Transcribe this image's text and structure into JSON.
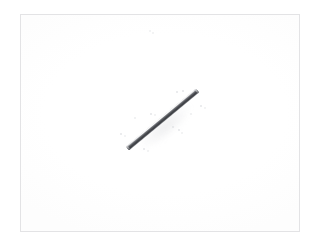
{
  "viewer": {
    "name": "photo-viewer",
    "background_color": "#ffffff",
    "width": 316,
    "height": 245
  },
  "frame": {
    "name": "image-frame",
    "border_color": "#e3e3e5",
    "border_width": 1,
    "left": 20,
    "top": 14,
    "width": 280,
    "height": 218,
    "fill_color": "#ffffff"
  },
  "subject": {
    "label": "metal rod",
    "type": "cylindrical rod",
    "orientation": "diagonal, lower-left to upper-right",
    "angle_degrees": -39.6,
    "start_point": {
      "x": 126,
      "y": 147
    },
    "end_point": {
      "x": 196,
      "y": 89
    },
    "length_px": 91,
    "thickness_px": 5,
    "body_color": "#4a4c51",
    "shadow_color": "#3c3e43",
    "highlight_color": "#ffffff",
    "cap_color": "#55575c"
  },
  "shadow": {
    "name": "rod-shadow",
    "color": "#aaacb2",
    "opacity": 0.2
  },
  "specks": [
    {
      "x": 149,
      "y": 30,
      "r": 1.2,
      "dim": true
    },
    {
      "x": 152,
      "y": 32,
      "r": 0.9,
      "dim": true
    },
    {
      "x": 176,
      "y": 91,
      "r": 1.1,
      "dim": false
    },
    {
      "x": 182,
      "y": 90,
      "r": 1.0,
      "dim": false
    },
    {
      "x": 200,
      "y": 105,
      "r": 1.1,
      "dim": false
    },
    {
      "x": 204,
      "y": 107,
      "r": 0.9,
      "dim": true
    },
    {
      "x": 150,
      "y": 113,
      "r": 1.2,
      "dim": false
    },
    {
      "x": 154,
      "y": 114,
      "r": 0.9,
      "dim": true
    },
    {
      "x": 172,
      "y": 126,
      "r": 1.1,
      "dim": false
    },
    {
      "x": 178,
      "y": 129,
      "r": 1.0,
      "dim": false
    },
    {
      "x": 181,
      "y": 132,
      "r": 0.9,
      "dim": true
    },
    {
      "x": 120,
      "y": 133,
      "r": 1.2,
      "dim": false
    },
    {
      "x": 124,
      "y": 135,
      "r": 1.0,
      "dim": true
    },
    {
      "x": 143,
      "y": 148,
      "r": 1.2,
      "dim": false
    },
    {
      "x": 147,
      "y": 150,
      "r": 0.9,
      "dim": true
    },
    {
      "x": 134,
      "y": 117,
      "r": 0.8,
      "dim": true
    },
    {
      "x": 190,
      "y": 113,
      "r": 0.8,
      "dim": true
    }
  ]
}
